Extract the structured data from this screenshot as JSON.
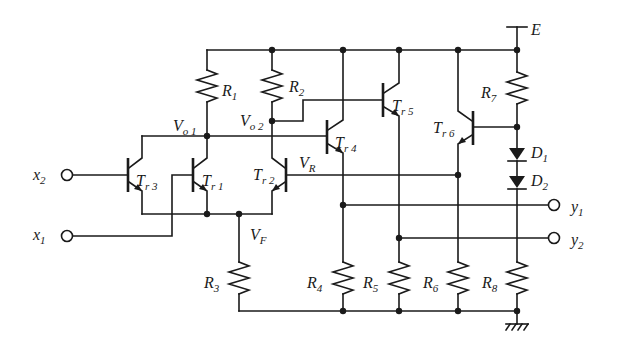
{
  "diagram": {
    "type": "circuit-schematic",
    "supply": {
      "label": "E"
    },
    "ground": {
      "label": "ground"
    },
    "inputs": [
      {
        "id": "x2",
        "main": "x",
        "sub": "2"
      },
      {
        "id": "x1",
        "main": "x",
        "sub": "1"
      }
    ],
    "outputs": [
      {
        "id": "y1",
        "main": "y",
        "sub": "1"
      },
      {
        "id": "y2",
        "main": "y",
        "sub": "2"
      }
    ],
    "resistors": [
      {
        "id": "R1",
        "main": "R",
        "sub": "1"
      },
      {
        "id": "R2",
        "main": "R",
        "sub": "2"
      },
      {
        "id": "R3",
        "main": "R",
        "sub": "3"
      },
      {
        "id": "R4",
        "main": "R",
        "sub": "4"
      },
      {
        "id": "R5",
        "main": "R",
        "sub": "5"
      },
      {
        "id": "R6",
        "main": "R",
        "sub": "6"
      },
      {
        "id": "R7",
        "main": "R",
        "sub": "7"
      },
      {
        "id": "R8",
        "main": "R",
        "sub": "8"
      }
    ],
    "transistors": [
      {
        "id": "Tr1",
        "main": "T",
        "sub": "r 1"
      },
      {
        "id": "Tr2",
        "main": "T",
        "sub": "r 2"
      },
      {
        "id": "Tr3",
        "main": "T",
        "sub": "r 3"
      },
      {
        "id": "Tr4",
        "main": "T",
        "sub": "r 4"
      },
      {
        "id": "Tr5",
        "main": "T",
        "sub": "r 5"
      },
      {
        "id": "Tr6",
        "main": "T",
        "sub": "r 6"
      }
    ],
    "diodes": [
      {
        "id": "D1",
        "main": "D",
        "sub": "1"
      },
      {
        "id": "D2",
        "main": "D",
        "sub": "2"
      }
    ],
    "nodes": [
      {
        "id": "Vo1",
        "main": "V",
        "sub": "o 1"
      },
      {
        "id": "Vo2",
        "main": "V",
        "sub": "o 2"
      },
      {
        "id": "VR",
        "main": "V",
        "sub": "R"
      },
      {
        "id": "VF",
        "main": "V",
        "sub": "F"
      }
    ]
  }
}
